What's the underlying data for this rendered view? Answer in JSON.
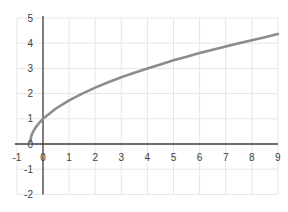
{
  "chart_data": {
    "type": "line",
    "title": "",
    "xlabel": "",
    "ylabel": "",
    "xlim": [
      -1,
      9
    ],
    "ylim": [
      -2,
      5
    ],
    "grid": true,
    "legend": null,
    "x_ticks": [
      -1,
      0,
      1,
      2,
      3,
      4,
      5,
      6,
      7,
      8,
      9
    ],
    "y_ticks": [
      -2,
      -1,
      0,
      1,
      2,
      3,
      4,
      5
    ],
    "series": [
      {
        "name": "y = sqrt(2x + 1)",
        "color": "#8c8c8c",
        "x": [
          -0.5,
          -0.45,
          -0.4,
          -0.3,
          -0.2,
          -0.1,
          0,
          0.5,
          1,
          1.5,
          2,
          2.5,
          3,
          3.5,
          4,
          4.5,
          5,
          5.5,
          6,
          6.5,
          7,
          7.5,
          8,
          8.5,
          9
        ],
        "values": [
          0,
          0.32,
          0.45,
          0.63,
          0.77,
          0.89,
          1,
          1.41,
          1.73,
          2,
          2.24,
          2.45,
          2.65,
          2.83,
          3,
          3.16,
          3.32,
          3.46,
          3.61,
          3.74,
          3.87,
          4,
          4.12,
          4.24,
          4.36
        ]
      }
    ]
  },
  "colors": {
    "grid": "#e6e6e6",
    "axis": "#404040",
    "curve": "#8c8c8c",
    "label": "#404040"
  }
}
